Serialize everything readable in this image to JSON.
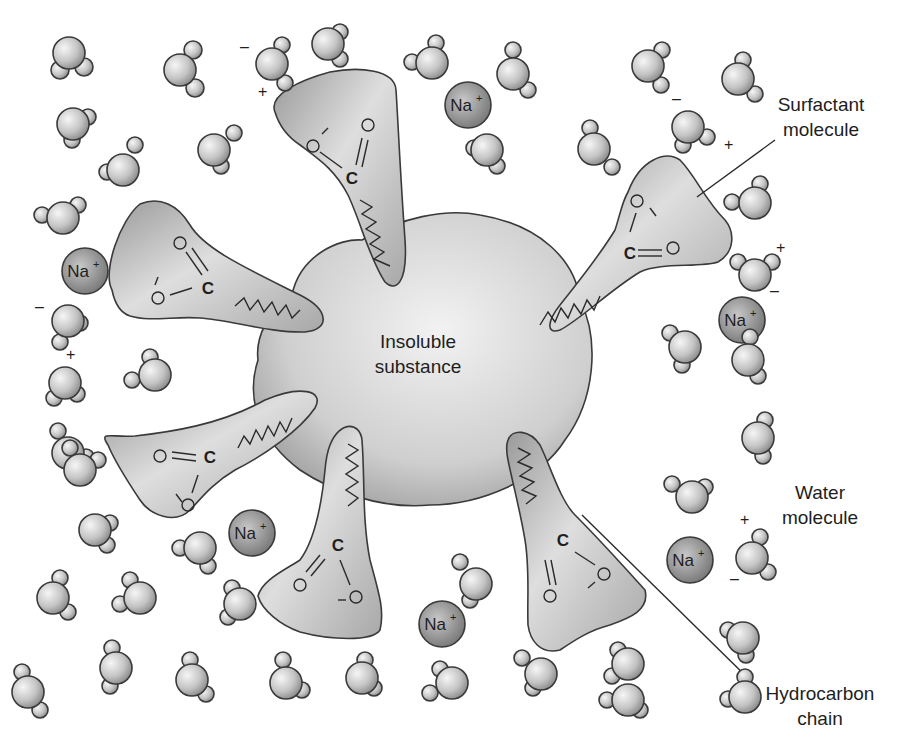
{
  "figure": {
    "center_label": {
      "line1": "Insoluble",
      "line2": "substance"
    },
    "callouts": {
      "surfactant": {
        "line1": "Surfactant",
        "line2": "molecule"
      },
      "water": {
        "line1": "Water",
        "line2": "molecule"
      },
      "hydrocarbon": {
        "line1": "Hydrocarbon",
        "line2": "chain"
      }
    },
    "ion_label": {
      "symbol": "Na",
      "charge": "+"
    },
    "carbon_label": "C",
    "charge_symbols": {
      "plus": "+",
      "minus": "–"
    },
    "colors": {
      "background": "#ffffff",
      "water_light": "#f2f2f2",
      "water_dark": "#8a8a8a",
      "sodium_light": "#bdbdbd",
      "sodium_dark": "#6e6e6e",
      "blob_light": "#ececec",
      "blob_dark": "#9a9a9a",
      "surfactant_light": "#e4e4e4",
      "surfactant_dark": "#8c8c8c",
      "outline": "#3a3a3a"
    }
  }
}
